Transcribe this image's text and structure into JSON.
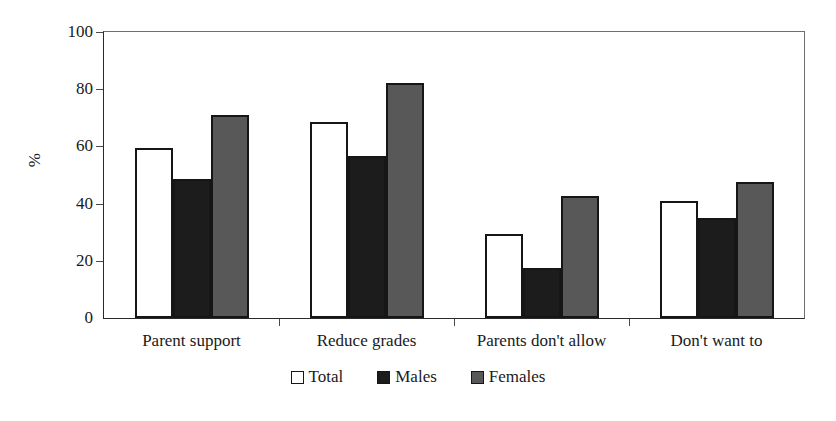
{
  "chart_data": {
    "type": "bar",
    "title": "",
    "xlabel": "",
    "ylabel": "%",
    "ylim": [
      0,
      100
    ],
    "yticks": [
      0,
      20,
      40,
      60,
      80,
      100
    ],
    "grid": false,
    "legend_position": "bottom",
    "categories": [
      "Parent support",
      "Reduce grades",
      "Parents don't allow",
      "Don't want to"
    ],
    "series": [
      {
        "name": "Total",
        "color": "#ffffff",
        "values": [
          59.5,
          68.5,
          29.5,
          41.0
        ]
      },
      {
        "name": "Males",
        "color": "#1c1c1c",
        "values": [
          48.5,
          56.5,
          17.5,
          35.0
        ]
      },
      {
        "name": "Females",
        "color": "#585858",
        "values": [
          71.0,
          82.0,
          42.5,
          47.5
        ]
      }
    ]
  },
  "axis": {
    "y_title": "%",
    "y_tick_labels": [
      "100",
      "80",
      "60",
      "40",
      "20",
      "0"
    ]
  },
  "legend": {
    "items": [
      {
        "label": "Total"
      },
      {
        "label": "Males"
      },
      {
        "label": "Females"
      }
    ]
  },
  "colors": {
    "total": "#ffffff",
    "males": "#1c1c1c",
    "females": "#585858",
    "axis": "#2a2a2a",
    "background": "#ffffff"
  }
}
